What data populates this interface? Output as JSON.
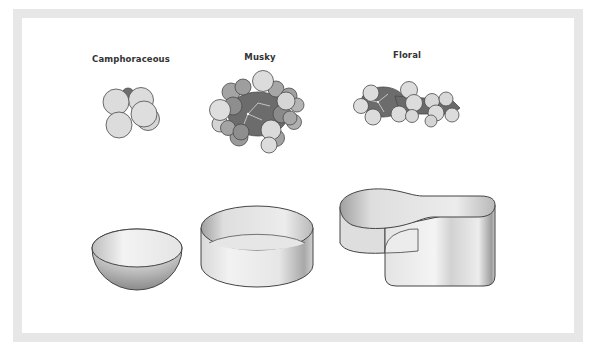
{
  "figure": {
    "molecules": [
      {
        "label": "Camphoraceous",
        "shape": "sphere-cluster"
      },
      {
        "label": "Musky",
        "shape": "disc-cluster"
      },
      {
        "label": "Floral",
        "shape": "elongated-cluster"
      }
    ],
    "receptor_sites": [
      {
        "name": "bowl-site",
        "shape": "hemispherical-bowl"
      },
      {
        "name": "disc-site",
        "shape": "shallow-cylinder"
      },
      {
        "name": "keyhole-site",
        "shape": "keyhole-cavity"
      }
    ],
    "colors": {
      "frame": "#e7e7e7",
      "atom_light": "#dcdcdc",
      "atom_mid": "#a9a9a9",
      "atom_dark": "#6e6e6e",
      "outline": "#444444",
      "label": "#333333"
    }
  }
}
